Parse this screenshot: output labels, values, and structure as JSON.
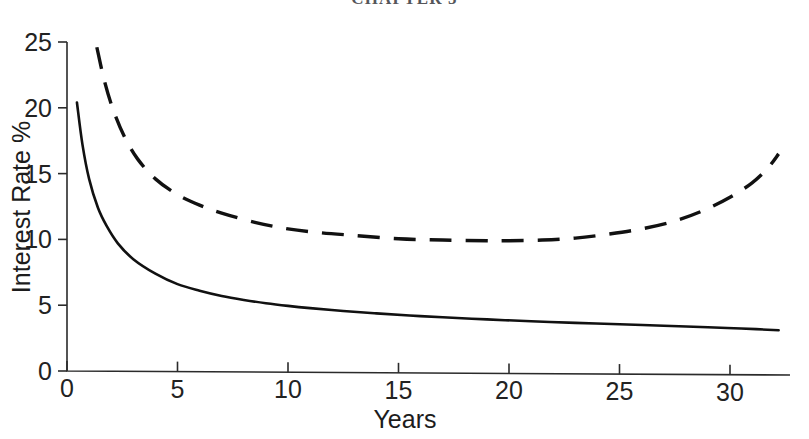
{
  "page": {
    "running_head": "CHAPTER 5",
    "background_color": "#ffffff",
    "ink_color": "#111111"
  },
  "chart_data": {
    "type": "line",
    "title": "",
    "subtitle": "",
    "xlabel": "Years",
    "ylabel": "Interest Rate %",
    "xlim": [
      0,
      32.5
    ],
    "ylim": [
      0,
      25
    ],
    "xticks": [
      0,
      5,
      10,
      15,
      20,
      25,
      30
    ],
    "xtick_labels": [
      "0",
      "5",
      "10",
      "15",
      "20",
      "25",
      "30"
    ],
    "yticks": [
      0,
      5,
      10,
      15,
      20,
      25
    ],
    "ytick_labels": [
      "0",
      "5",
      "10",
      "15",
      "20",
      "25"
    ],
    "grid": false,
    "legend": false,
    "legend_position": "none",
    "annotations": [],
    "series": [
      {
        "name": "Solid curve",
        "style": "solid",
        "color": "#111111",
        "x": [
          0.45,
          0.7,
          1.0,
          1.4,
          1.8,
          2.3,
          3.0,
          4.0,
          5.0,
          6.0,
          7.0,
          8.0,
          9.0,
          10.0,
          11.0,
          12.5,
          14.0,
          15.5,
          17.0,
          19.0,
          21.0,
          23.0,
          25.0,
          27.0,
          29.0,
          30.5,
          32.2
        ],
        "y": [
          20.4,
          17.2,
          14.6,
          12.4,
          11.0,
          9.7,
          8.5,
          7.4,
          6.6,
          6.1,
          5.7,
          5.4,
          5.15,
          4.95,
          4.78,
          4.56,
          4.38,
          4.22,
          4.08,
          3.92,
          3.78,
          3.66,
          3.55,
          3.44,
          3.32,
          3.23,
          3.1
        ]
      },
      {
        "name": "Dashed curve",
        "style": "dashed",
        "color": "#111111",
        "x": [
          1.35,
          1.7,
          2.1,
          2.6,
          3.2,
          4.0,
          5.0,
          6.0,
          7.0,
          8.5,
          10.0,
          11.5,
          13.0,
          15.0,
          17.0,
          19.0,
          20.0,
          21.5,
          23.0,
          24.5,
          26.0,
          27.5,
          28.8,
          30.0,
          31.0,
          31.7,
          32.2
        ],
        "y": [
          24.6,
          22.0,
          19.8,
          17.8,
          16.1,
          14.6,
          13.4,
          12.6,
          12.0,
          11.3,
          10.8,
          10.5,
          10.3,
          10.05,
          9.95,
          9.9,
          9.9,
          9.95,
          10.1,
          10.4,
          10.8,
          11.4,
          12.2,
          13.2,
          14.3,
          15.4,
          16.5
        ]
      }
    ]
  }
}
